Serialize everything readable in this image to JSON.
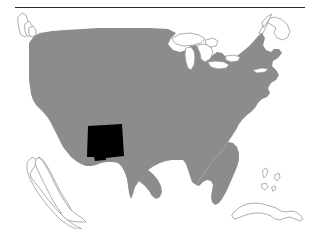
{
  "figure": {
    "kind": "map",
    "title": "",
    "caption": "",
    "background_color": "#ffffff",
    "width": 314,
    "height": 229
  },
  "top_rule": {
    "name": "horizontal-rule",
    "color": "#2b2b2b",
    "x": 15,
    "y": 7,
    "width": 290,
    "thickness": 1
  },
  "map": {
    "region": "United States (contiguous 48 states)",
    "projection_note": "simplified outline",
    "landmass_fill": "#8c8c8c",
    "outline_color": "#9a9a9a",
    "outline_width": 0.8,
    "water_fill": "#ffffff",
    "highlight": {
      "name": "New Mexico",
      "fill": "#000000",
      "bbox": {
        "x": 87,
        "y": 124,
        "width": 37,
        "height": 36
      }
    },
    "features": [
      {
        "name": "contiguous-united-states",
        "style": "filled-gray"
      },
      {
        "name": "great-lakes",
        "style": "outlined-white"
      },
      {
        "name": "baja-california",
        "style": "outlined-white"
      },
      {
        "name": "cuba",
        "style": "outlined-white"
      },
      {
        "name": "bahamas",
        "style": "outlined-white"
      },
      {
        "name": "vancouver-island",
        "style": "outlined-white"
      },
      {
        "name": "maine-coast",
        "style": "outlined-white"
      },
      {
        "name": "long-island",
        "style": "outlined-white"
      }
    ]
  }
}
